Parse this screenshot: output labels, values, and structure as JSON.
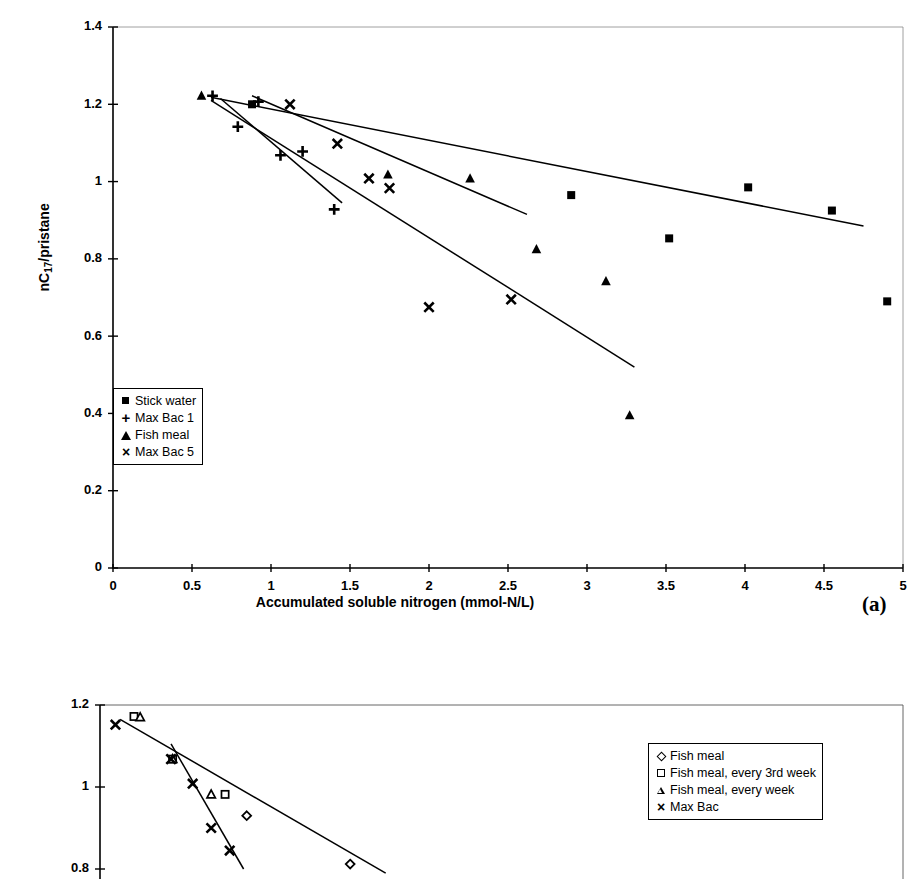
{
  "figure": {
    "panel_a_tag": "(a)"
  },
  "panel_a": {
    "ylabel_pre": "nC",
    "ylabel_sub": "17",
    "ylabel_post": "/pristane",
    "xlabel": "Accumulated soluble nitrogen (mmol-N/L)",
    "legend": [
      {
        "key": "filled-square",
        "label": "Stick water"
      },
      {
        "key": "plus",
        "label": "Max Bac 1"
      },
      {
        "key": "filled-triangle",
        "label": "Fish meal"
      },
      {
        "key": "times",
        "label": "Max Bac 5"
      }
    ]
  },
  "panel_b": {
    "legend": [
      {
        "key": "open-diamond",
        "label": "Fish meal"
      },
      {
        "key": "open-square",
        "label": "Fish meal, every 3rd week"
      },
      {
        "key": "open-triangle",
        "label": "Fish meal, every week"
      },
      {
        "key": "times",
        "label": "Max Bac"
      }
    ]
  },
  "chart_data": [
    {
      "id": "panel-a",
      "type": "scatter",
      "title": "",
      "xlabel": "Accumulated soluble nitrogen (mmol-N/L)",
      "ylabel": "nC17/pristane",
      "xlim": [
        0,
        5
      ],
      "ylim": [
        0,
        1.4
      ],
      "xticks": [
        0,
        0.5,
        1,
        1.5,
        2,
        2.5,
        3,
        3.5,
        4,
        4.5,
        5
      ],
      "xtick_labels": [
        "0",
        "0.5",
        "1",
        "1.5",
        "2",
        "2.5",
        "3",
        "3.5",
        "4",
        "4.5",
        "5"
      ],
      "yticks": [
        0,
        0.2,
        0.4,
        0.6,
        0.8,
        1,
        1.2,
        1.4
      ],
      "ytick_labels": [
        "0",
        "0.2",
        "0.4",
        "0.6",
        "0.8",
        "1",
        "1.2",
        "1.4"
      ],
      "grid": false,
      "legend_position": "lower-left-inside",
      "series": [
        {
          "name": "Stick water",
          "marker": "filled-square",
          "points": [
            [
              0.88,
              1.2
            ],
            [
              2.9,
              0.965
            ],
            [
              3.52,
              0.853
            ],
            [
              4.02,
              0.985
            ],
            [
              4.55,
              0.925
            ],
            [
              4.9,
              0.69
            ]
          ],
          "trendline": [
            [
              0.62,
              1.218
            ],
            [
              4.75,
              0.885
            ]
          ]
        },
        {
          "name": "Max Bac 1",
          "marker": "plus",
          "points": [
            [
              0.63,
              1.222
            ],
            [
              0.79,
              1.142
            ],
            [
              0.92,
              1.207
            ],
            [
              1.06,
              1.068
            ],
            [
              1.2,
              1.078
            ],
            [
              1.4,
              0.928
            ]
          ],
          "trendline": [
            [
              0.68,
              1.215
            ],
            [
              1.45,
              0.945
            ]
          ]
        },
        {
          "name": "Fish meal",
          "marker": "filled-triangle",
          "points": [
            [
              0.56,
              1.222
            ],
            [
              1.74,
              1.018
            ],
            [
              2.26,
              1.008
            ],
            [
              2.68,
              0.825
            ],
            [
              3.12,
              0.742
            ],
            [
              3.27,
              0.395
            ]
          ],
          "trendline": [
            [
              0.62,
              1.21
            ],
            [
              3.3,
              0.52
            ]
          ]
        },
        {
          "name": "Max Bac 5",
          "marker": "times",
          "points": [
            [
              1.12,
              1.2
            ],
            [
              1.42,
              1.098
            ],
            [
              1.62,
              1.008
            ],
            [
              1.75,
              0.983
            ],
            [
              2.0,
              0.675
            ],
            [
              2.52,
              0.695
            ]
          ],
          "trendline": [
            [
              0.88,
              1.222
            ],
            [
              2.62,
              0.915
            ]
          ]
        }
      ]
    },
    {
      "id": "panel-b",
      "type": "scatter",
      "title": "",
      "xlabel": "",
      "ylabel": "",
      "ylim": [
        0.8,
        1.2
      ],
      "yticks": [
        0.8,
        1,
        1.2
      ],
      "ytick_labels": [
        "0.8",
        "1",
        "1.2"
      ],
      "grid": false,
      "legend_position": "right",
      "note": "Lower portion of this panel is cropped off the bottom of the screenshot",
      "series": [
        {
          "name": "Fish meal",
          "marker": "open-diamond",
          "points": [
            [
              0.95,
              0.93
            ],
            [
              1.62,
              0.812
            ]
          ]
        },
        {
          "name": "Fish meal, every 3rd week",
          "marker": "open-square",
          "points": [
            [
              0.22,
              1.172
            ],
            [
              0.47,
              1.068
            ],
            [
              0.81,
              0.982
            ]
          ]
        },
        {
          "name": "Fish meal, every week",
          "marker": "open-triangle",
          "points": [
            [
              0.26,
              1.17
            ],
            [
              0.47,
              1.068
            ],
            [
              0.72,
              0.982
            ]
          ]
        },
        {
          "name": "Max Bac",
          "marker": "times",
          "points": [
            [
              0.1,
              1.152
            ],
            [
              0.46,
              1.068
            ],
            [
              0.6,
              1.008
            ],
            [
              0.72,
              0.9
            ],
            [
              0.84,
              0.845
            ]
          ]
        }
      ],
      "trendlines": [
        [
          [
            0.13,
            1.165
          ],
          [
            1.85,
            0.79
          ]
        ],
        [
          [
            0.46,
            1.105
          ],
          [
            0.93,
            0.8
          ]
        ]
      ]
    }
  ]
}
